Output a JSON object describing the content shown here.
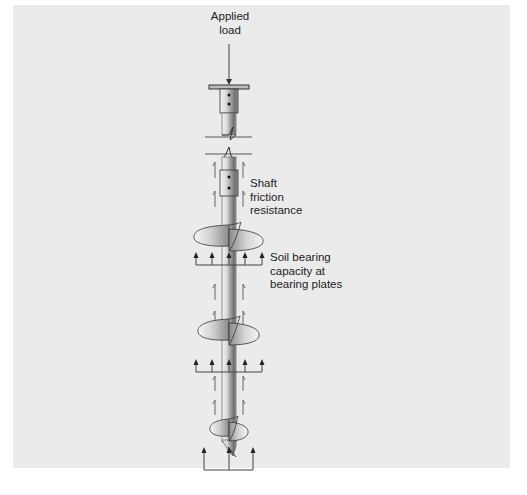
{
  "figure": {
    "type": "helical pile load transfer diagram",
    "colors": {
      "panel_background": "#ebebeb",
      "page_background": "#ffffff",
      "line": "#444444",
      "text": "#222222",
      "shaft_light": "#f2f2f2",
      "shaft_dark": "#7a7a7a"
    },
    "labels": {
      "applied_load_line1": "Applied",
      "applied_load_line2": "load",
      "shaft_friction_line1": "Shaft",
      "shaft_friction_line2": "friction",
      "shaft_friction_line3": "resistance",
      "soil_bearing_line1": "Soil bearing",
      "soil_bearing_line2": "capacity at",
      "soil_bearing_line3": "bearing plates"
    },
    "components": {
      "pile_cap": "bearing cap plate with bolts",
      "shaft_break": "zig-zag break line",
      "shaft_couplings": 1,
      "helix_plates": 3,
      "bearing_arrow_rows": 3
    }
  }
}
